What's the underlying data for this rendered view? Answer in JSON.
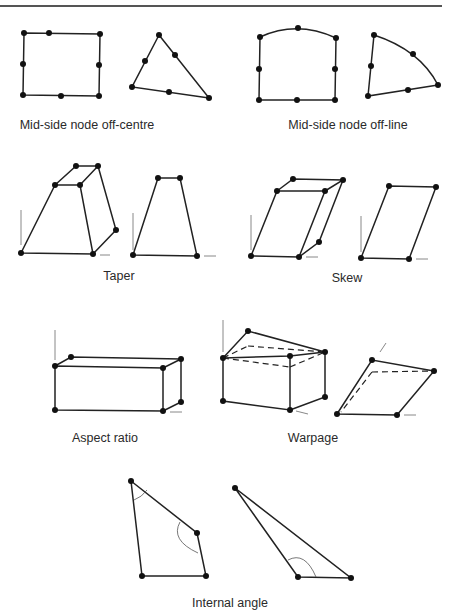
{
  "captions": {
    "offcentre": "Mid-side node off-centre",
    "offline": "Mid-side node off-line",
    "taper": "Taper",
    "skew": "Skew",
    "aspect": "Aspect ratio",
    "warpage": "Warpage",
    "internal": "Internal angle"
  }
}
